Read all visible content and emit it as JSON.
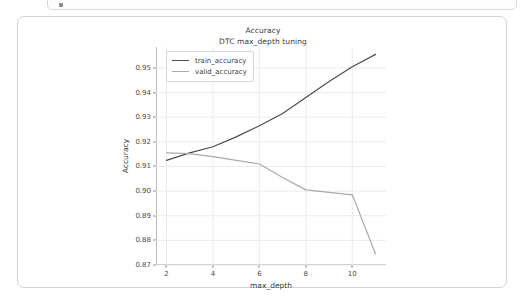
{
  "notebook": {
    "cell_marker": "cell-indicator-dot"
  },
  "chart_data": {
    "type": "line",
    "title": "Accuracy",
    "subtitle": "DTC max_depth tuning",
    "xlabel": "max_depth",
    "ylabel": "Accuracy",
    "grid": true,
    "legend_position": "upper left",
    "x": [
      2,
      3,
      4,
      5,
      6,
      7,
      8,
      9,
      10,
      11
    ],
    "xlim": [
      1.55,
      11.45
    ],
    "ylim": [
      0.87,
      0.9585
    ],
    "xticks": [
      2,
      4,
      6,
      8,
      10
    ],
    "xtick_labels": [
      "2",
      "4",
      "6",
      "8",
      "10"
    ],
    "yticks": [
      0.87,
      0.88,
      0.89,
      0.9,
      0.91,
      0.92,
      0.93,
      0.94,
      0.95
    ],
    "ytick_labels": [
      "0.87",
      "0.88",
      "0.89",
      "0.90",
      "0.91",
      "0.92",
      "0.93",
      "0.94",
      "0.95"
    ],
    "series": [
      {
        "name": "train_accuracy",
        "color": "#4c4c4c",
        "values": [
          0.9125,
          0.9155,
          0.918,
          0.922,
          0.9265,
          0.9315,
          0.938,
          0.9445,
          0.9505,
          0.9555
        ]
      },
      {
        "name": "valid_accuracy",
        "color": "#aaaaaa",
        "values": [
          0.9155,
          0.9152,
          0.914,
          0.9125,
          0.911,
          0.9055,
          0.9005,
          0.8995,
          0.8985,
          0.8745
        ]
      }
    ]
  }
}
